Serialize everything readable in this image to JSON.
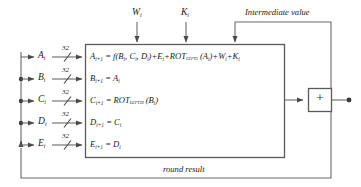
{
  "diagram": {
    "line_color": "#5a5a5a",
    "text_color": "#1a1a1a",
    "bus_width_label": "32",
    "inputs": [
      {
        "name": "A",
        "label": "A",
        "subscript": "i",
        "bus": "32"
      },
      {
        "name": "B",
        "label": "B",
        "subscript": "i",
        "bus": "32"
      },
      {
        "name": "C",
        "label": "C",
        "subscript": "i",
        "bus": "32"
      },
      {
        "name": "D",
        "label": "D",
        "subscript": "i",
        "bus": "32"
      },
      {
        "name": "E",
        "label": "E",
        "subscript": "i",
        "bus": "32"
      }
    ],
    "top_inputs": [
      {
        "name": "W",
        "label": "W",
        "subscript": "i"
      },
      {
        "name": "K",
        "label": "K",
        "subscript": "i"
      }
    ],
    "equations": [
      {
        "lhs": "A",
        "lhs_sub": "i+1",
        "rhs_parts": [
          {
            "t": "= f(B"
          },
          {
            "s": "i"
          },
          {
            "t": ", C"
          },
          {
            "s": "i"
          },
          {
            "t": ", D"
          },
          {
            "s": "i"
          },
          {
            "t": ")+E"
          },
          {
            "s": "i"
          },
          {
            "t": "+ROT"
          },
          {
            "ss": "LEFT5"
          },
          {
            "t": " (A"
          },
          {
            "s": "i"
          },
          {
            "t": ")+W"
          },
          {
            "s": "i"
          },
          {
            "t": "+K"
          },
          {
            "s": "i"
          }
        ]
      },
      {
        "lhs": "B",
        "lhs_sub": "i+1",
        "rhs_parts": [
          {
            "t": "= A"
          },
          {
            "s": "i"
          }
        ]
      },
      {
        "lhs": "C",
        "lhs_sub": "i+1",
        "rhs_parts": [
          {
            "t": "= ROT"
          },
          {
            "ss": "LEFT30"
          },
          {
            "t": " (B"
          },
          {
            "s": "i"
          },
          {
            "t": ")"
          }
        ]
      },
      {
        "lhs": "D",
        "lhs_sub": "i+1",
        "rhs_parts": [
          {
            "t": "= C"
          },
          {
            "s": "i"
          }
        ]
      },
      {
        "lhs": "E",
        "lhs_sub": "i+1",
        "rhs_parts": [
          {
            "t": "= D"
          },
          {
            "s": "i"
          }
        ]
      }
    ],
    "adder": {
      "symbol": "+"
    },
    "captions": {
      "intermediate_value": "Intermediate value",
      "round_result": "round result"
    }
  }
}
